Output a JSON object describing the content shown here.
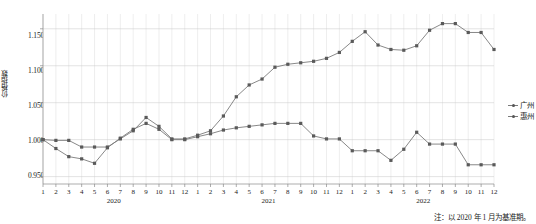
{
  "axis": {
    "y_label": "价格指数",
    "y_ticks": [
      "1.150",
      "1.100",
      "1.050",
      "1.000",
      "0.950"
    ],
    "year_labels": [
      "2020",
      "2021",
      "2022"
    ],
    "month_labels": [
      "1",
      "2",
      "3",
      "4",
      "5",
      "6",
      "7",
      "8",
      "9",
      "10",
      "11",
      "12"
    ]
  },
  "legend": {
    "items": [
      {
        "label": "广州",
        "color": "#7a7a7a"
      },
      {
        "label": "惠州",
        "color": "#7a7a7a"
      }
    ]
  },
  "note": "注：以 2020 年 1 月为基准期。",
  "chart_data": {
    "type": "line",
    "title": "",
    "xlabel": "",
    "ylabel": "价格指数",
    "ylim": [
      0.94,
      1.17
    ],
    "grid": true,
    "legend_position": "right",
    "categories": [
      "2020-1",
      "2020-2",
      "2020-3",
      "2020-4",
      "2020-5",
      "2020-6",
      "2020-7",
      "2020-8",
      "2020-9",
      "2020-10",
      "2020-11",
      "2020-12",
      "2021-1",
      "2021-2",
      "2021-3",
      "2021-4",
      "2021-5",
      "2021-6",
      "2021-7",
      "2021-8",
      "2021-9",
      "2021-10",
      "2021-11",
      "2021-12",
      "2022-1",
      "2022-2",
      "2022-3",
      "2022-4",
      "2022-5",
      "2022-6",
      "2022-7",
      "2022-8",
      "2022-9",
      "2022-10",
      "2022-11",
      "2022-12"
    ],
    "series": [
      {
        "name": "广州",
        "color": "#7a7a7a",
        "values": [
          1.0,
          0.999,
          0.999,
          0.99,
          0.99,
          0.99,
          1.001,
          1.012,
          1.03,
          1.018,
          1.001,
          1.001,
          1.006,
          1.012,
          1.032,
          1.058,
          1.074,
          1.082,
          1.098,
          1.102,
          1.104,
          1.106,
          1.11,
          1.118,
          1.133,
          1.146,
          1.128,
          1.122,
          1.121,
          1.127,
          1.148,
          1.157,
          1.157,
          1.145,
          1.145,
          1.122
        ]
      },
      {
        "name": "惠州",
        "color": "#7a7a7a",
        "values": [
          1.0,
          0.988,
          0.977,
          0.974,
          0.968,
          0.989,
          1.002,
          1.014,
          1.022,
          1.014,
          1.0,
          1.0,
          1.004,
          1.008,
          1.013,
          1.016,
          1.018,
          1.02,
          1.022,
          1.022,
          1.022,
          1.005,
          1.001,
          1.001,
          0.985,
          0.985,
          0.985,
          0.972,
          0.987,
          1.01,
          0.994,
          0.994,
          0.994,
          0.966,
          0.966,
          0.966
        ]
      }
    ]
  }
}
